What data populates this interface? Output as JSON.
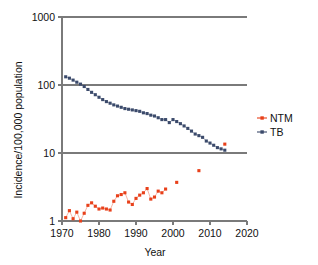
{
  "chart_data": {
    "type": "line",
    "title": "",
    "subtitle": "",
    "xlabel": "Year",
    "ylabel": "Incidence/100,000 population",
    "xlim": [
      1970,
      2020
    ],
    "ylim": [
      1,
      1000
    ],
    "yscale": "log",
    "xscale": "linear",
    "grid": true,
    "gridlines_y": [
      1,
      10,
      100,
      1000
    ],
    "xticks": [
      1970,
      1980,
      1990,
      2000,
      2010,
      2020
    ],
    "xtick_labels": [
      "1970",
      "1980",
      "1990",
      "2000",
      "2010",
      "2020"
    ],
    "yticks": [
      1,
      10,
      100,
      1000
    ],
    "ytick_labels": [
      "1",
      "10",
      "100",
      "1000"
    ],
    "legend_position": "right",
    "series": [
      {
        "name": "NTM",
        "color": "#E8401A",
        "marker": "square",
        "points": [
          {
            "x": 1971,
            "y": 1.12
          },
          {
            "x": 1972,
            "y": 1.42
          },
          {
            "x": 1973,
            "y": 1.08
          },
          {
            "x": 1974,
            "y": 1.35
          },
          {
            "x": 1975,
            "y": 1.0
          },
          {
            "x": 1976,
            "y": 1.3
          },
          {
            "x": 1977,
            "y": 1.7
          },
          {
            "x": 1978,
            "y": 1.85
          },
          {
            "x": 1979,
            "y": 1.65
          },
          {
            "x": 1980,
            "y": 1.5
          },
          {
            "x": 1981,
            "y": 1.55
          },
          {
            "x": 1982,
            "y": 1.5
          },
          {
            "x": 1983,
            "y": 1.45
          },
          {
            "x": 1984,
            "y": 1.95
          },
          {
            "x": 1985,
            "y": 2.35
          },
          {
            "x": 1986,
            "y": 2.45
          },
          {
            "x": 1987,
            "y": 2.6
          },
          {
            "x": 1988,
            "y": 1.9
          },
          {
            "x": 1989,
            "y": 1.75
          },
          {
            "x": 1990,
            "y": 2.15
          },
          {
            "x": 1991,
            "y": 2.4
          },
          {
            "x": 1992,
            "y": 2.6
          },
          {
            "x": 1993,
            "y": 3.0
          },
          {
            "x": 1994,
            "y": 2.1
          },
          {
            "x": 1995,
            "y": 2.25
          },
          {
            "x": 1996,
            "y": 2.75
          },
          {
            "x": 1997,
            "y": 2.6
          },
          {
            "x": 1998,
            "y": 2.95
          },
          {
            "x": 2001,
            "y": 3.7
          },
          {
            "x": 2007,
            "y": 5.5
          },
          {
            "x": 2014,
            "y": 13.5
          }
        ]
      },
      {
        "name": "TB",
        "color": "#3B4A6B",
        "marker": "square",
        "points": [
          {
            "x": 1971,
            "y": 132
          },
          {
            "x": 1972,
            "y": 126
          },
          {
            "x": 1973,
            "y": 118
          },
          {
            "x": 1974,
            "y": 110
          },
          {
            "x": 1975,
            "y": 103
          },
          {
            "x": 1976,
            "y": 95
          },
          {
            "x": 1977,
            "y": 86
          },
          {
            "x": 1978,
            "y": 78
          },
          {
            "x": 1979,
            "y": 72
          },
          {
            "x": 1980,
            "y": 66
          },
          {
            "x": 1981,
            "y": 61
          },
          {
            "x": 1982,
            "y": 57
          },
          {
            "x": 1983,
            "y": 54
          },
          {
            "x": 1984,
            "y": 51
          },
          {
            "x": 1985,
            "y": 49
          },
          {
            "x": 1986,
            "y": 47
          },
          {
            "x": 1987,
            "y": 45
          },
          {
            "x": 1988,
            "y": 44
          },
          {
            "x": 1989,
            "y": 43
          },
          {
            "x": 1990,
            "y": 42
          },
          {
            "x": 1991,
            "y": 41
          },
          {
            "x": 1992,
            "y": 39
          },
          {
            "x": 1993,
            "y": 38
          },
          {
            "x": 1994,
            "y": 36
          },
          {
            "x": 1995,
            "y": 35
          },
          {
            "x": 1996,
            "y": 33
          },
          {
            "x": 1997,
            "y": 31
          },
          {
            "x": 1998,
            "y": 31
          },
          {
            "x": 1999,
            "y": 28
          },
          {
            "x": 2000,
            "y": 31
          },
          {
            "x": 2001,
            "y": 29
          },
          {
            "x": 2002,
            "y": 27
          },
          {
            "x": 2003,
            "y": 25
          },
          {
            "x": 2004,
            "y": 23
          },
          {
            "x": 2005,
            "y": 21
          },
          {
            "x": 2006,
            "y": 19
          },
          {
            "x": 2007,
            "y": 18
          },
          {
            "x": 2008,
            "y": 17
          },
          {
            "x": 2009,
            "y": 15
          },
          {
            "x": 2010,
            "y": 14
          },
          {
            "x": 2011,
            "y": 13
          },
          {
            "x": 2012,
            "y": 12
          },
          {
            "x": 2013,
            "y": 11.5
          },
          {
            "x": 2014,
            "y": 11
          }
        ]
      }
    ]
  },
  "axes": {
    "y_title": "Incidence/100,000 population",
    "x_title": "Year",
    "y_labels": [
      "1000",
      "100",
      "10",
      "1"
    ],
    "x_labels": [
      "1970",
      "1980",
      "1990",
      "2000",
      "2010",
      "2020"
    ]
  },
  "legend": {
    "entries": [
      {
        "label": "NTM",
        "color": "#E8401A"
      },
      {
        "label": "TB",
        "color": "#3B4A6B"
      }
    ]
  },
  "colors": {
    "ntm": "#E8401A",
    "tb": "#3B4A6B",
    "axis": "#7A7A7A",
    "text": "#111111",
    "background": "#FFFFFF"
  }
}
